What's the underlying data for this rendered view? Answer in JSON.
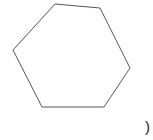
{
  "figure": {
    "shape": "hexagon",
    "stroke_color": "#555555",
    "fill": "#ffffff",
    "vertices": [
      [
        55,
        4
      ],
      [
        100,
        8
      ],
      [
        130,
        68
      ],
      [
        104,
        107
      ],
      [
        42,
        107
      ],
      [
        13,
        50
      ]
    ]
  },
  "caption": {
    "text": ")"
  }
}
